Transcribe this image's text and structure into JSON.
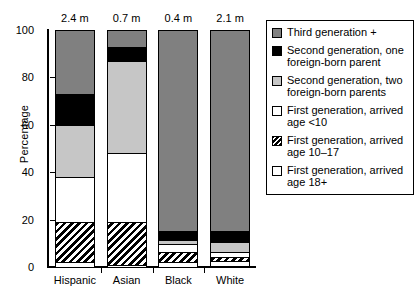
{
  "chart_data": {
    "type": "bar",
    "subtype": "stacked-bar-100",
    "title": "",
    "xlabel": "",
    "ylabel": "Percentage",
    "ylim": [
      0,
      100
    ],
    "yticks": [
      0,
      20,
      40,
      60,
      80,
      100
    ],
    "ytick_labels": [
      "0",
      "20",
      "40",
      "60",
      "80",
      "100"
    ],
    "grid": false,
    "legend_position": "right",
    "categories": [
      "Hispanic",
      "Asian",
      "Black",
      "White"
    ],
    "top_annotations": [
      "2.4 m",
      "0.7 m",
      "0.4 m",
      "2.1 m"
    ],
    "top_annotation_meaning": "population size in millions",
    "series": [
      {
        "name": "Third generation +",
        "values": [
          27,
          7,
          85,
          85
        ]
      },
      {
        "name": "Second generation, one foreign-born parent",
        "values": [
          13,
          6,
          3.5,
          4.5
        ]
      },
      {
        "name": "Second generation, two foreign-born parents",
        "values": [
          22,
          39,
          2,
          4
        ]
      },
      {
        "name": "First generation, arrived age <10",
        "values": [
          19,
          29,
          3,
          2.5
        ]
      },
      {
        "name": "First generation, arrived age 10–17",
        "values": [
          17,
          18,
          4.5,
          1.5
        ]
      },
      {
        "name": "First generation, arrived age 18+",
        "values": [
          2,
          1,
          2,
          2
        ]
      }
    ],
    "legend": [
      {
        "label": "Third generation +",
        "swatch": "dark-gray",
        "color": "#808080"
      },
      {
        "label": "Second generation, one\nforeign-born parent",
        "swatch": "black",
        "color": "#000000"
      },
      {
        "label": "Second generation, two\nforeign-born parents",
        "swatch": "light-gray",
        "color": "#c6c6c6"
      },
      {
        "label": "First generation, arrived\nage <10",
        "swatch": "white",
        "color": "#ffffff"
      },
      {
        "label": "First generation, arrived\nage 10–17",
        "swatch": "hatched",
        "color": "#000000"
      },
      {
        "label": "First generation, arrived\nage 18+",
        "swatch": "white",
        "color": "#ffffff"
      }
    ]
  }
}
